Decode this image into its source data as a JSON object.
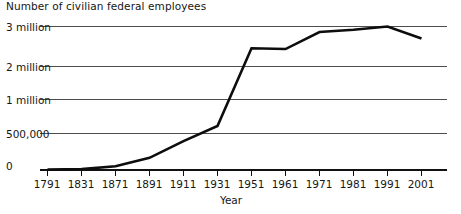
{
  "chart_data": {
    "type": "line",
    "title": "Number of civilian federal employees",
    "xlabel": "Year",
    "ylabel": "",
    "grid": true,
    "legend": "none",
    "x": [
      1791,
      1831,
      1871,
      1891,
      1911,
      1931,
      1951,
      1961,
      1971,
      1981,
      1991,
      2001
    ],
    "categories": [
      "1791",
      "1831",
      "1871",
      "1891",
      "1911",
      "1931",
      "1951",
      "1961",
      "1971",
      "1981",
      "1991",
      "2001"
    ],
    "values": [
      5000,
      12000,
      51000,
      166000,
      396000,
      610000,
      2456000,
      2436000,
      2862000,
      2920000,
      3048000,
      2700000
    ],
    "series": [
      {
        "name": "Civilian federal employees",
        "values": [
          5000,
          12000,
          51000,
          166000,
          396000,
          610000,
          2456000,
          2436000,
          2862000,
          2920000,
          3048000,
          2700000
        ]
      }
    ],
    "y_ticks": [
      {
        "label": "0",
        "value": 0
      },
      {
        "label": "500,000",
        "value": 500000
      },
      {
        "label": "1 million",
        "value": 1000000
      },
      {
        "label": "2 million",
        "value": 2000000
      },
      {
        "label": "3 million",
        "value": 3000000
      }
    ],
    "ylim": [
      0,
      3000000
    ],
    "y_axis_note": "non-linear tick spacing",
    "line_color": "#0d0d0d",
    "grid_color": "#4d4d4d",
    "background_color": "#ffffff"
  }
}
